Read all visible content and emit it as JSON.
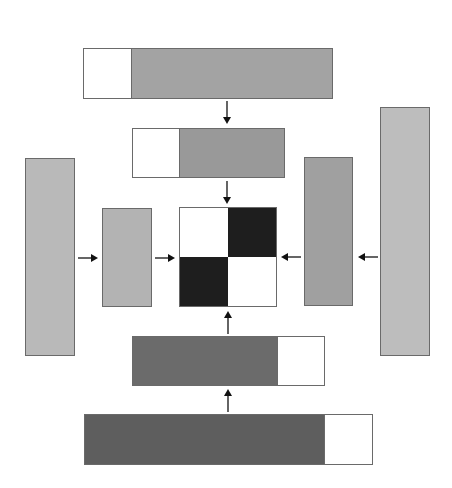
{
  "diagram": {
    "colors": {
      "light_gray": "#b9b9b9",
      "mid_gray": "#a3a3a3",
      "mid_dark_gray": "#999999",
      "dark_gray": "#6b6b6b",
      "darker_gray": "#5e5e5e",
      "black": "#1e1e1e",
      "white": "#ffffff",
      "border": "#6a6a6a",
      "arrow": "#111111"
    },
    "top_outer_bar": {
      "white_fraction": 0.19,
      "fill": "mid_gray",
      "white_side": "left"
    },
    "top_inner_bar": {
      "white_fraction": 0.31,
      "fill": "mid_dark_gray",
      "white_side": "left"
    },
    "left_outer_bar": {
      "fill": "light_gray"
    },
    "left_inner_bar": {
      "fill": "light_gray"
    },
    "right_inner_bar": {
      "fill": "mid_dark_gray"
    },
    "right_outer_bar": {
      "fill": "light_gray"
    },
    "bottom_inner_bar": {
      "white_fraction": 0.25,
      "fill": "dark_gray",
      "white_side": "right"
    },
    "bottom_outer_bar": {
      "white_fraction": 0.17,
      "fill": "darker_gray",
      "white_side": "right"
    },
    "center_grid": {
      "rows": 2,
      "cols": 2,
      "cells": [
        [
          "white",
          "black"
        ],
        [
          "black",
          "white"
        ]
      ]
    },
    "arrows": [
      {
        "id": "top-outer-to-top-inner",
        "direction": "down"
      },
      {
        "id": "top-inner-to-grid",
        "direction": "down"
      },
      {
        "id": "left-outer-to-left-inner",
        "direction": "right"
      },
      {
        "id": "left-inner-to-grid",
        "direction": "right"
      },
      {
        "id": "right-inner-to-grid",
        "direction": "left"
      },
      {
        "id": "right-outer-to-right-inner",
        "direction": "left"
      },
      {
        "id": "bottom-inner-to-grid",
        "direction": "up"
      },
      {
        "id": "bottom-outer-to-bottom-inner",
        "direction": "up"
      }
    ]
  }
}
